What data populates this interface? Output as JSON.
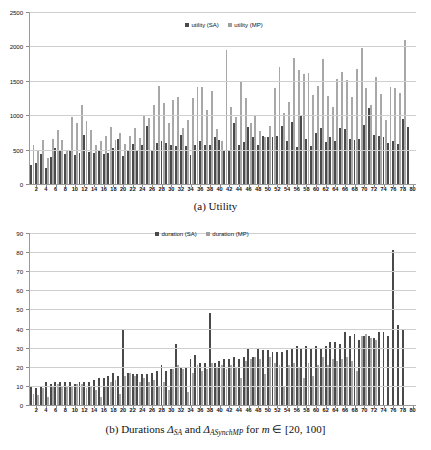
{
  "figure": {
    "panels": [
      {
        "id": "utility",
        "caption_prefix": "(a)",
        "caption_text": "Utility",
        "legend": [
          {
            "label": "utility (SA)",
            "color": "#4a4a4a",
            "key": "sa"
          },
          {
            "label": "utility (MP)",
            "color": "#9f9f9f",
            "key": "mp"
          }
        ]
      },
      {
        "id": "durations",
        "caption_prefix": "(b)",
        "caption_text": "Durations",
        "caption_sym1": "Δ",
        "caption_sub1": "SA",
        "caption_and": "and",
        "caption_sym2": "Δ",
        "caption_sub2": "ASynchMP",
        "caption_for": "for",
        "caption_var": "m",
        "caption_in": "∈",
        "caption_range": "[20, 100]",
        "legend": [
          {
            "label": "duration (SA)",
            "color": "#4a4a4a",
            "key": "sa"
          },
          {
            "label": "duration (MP)",
            "color": "#9f9f9f",
            "key": "mp"
          }
        ]
      }
    ]
  },
  "chart_data": [
    {
      "type": "bar",
      "id": "utility",
      "title": "(a) Utility",
      "xlabel": "",
      "ylabel": "",
      "ylim": [
        0,
        2500
      ],
      "yticks": [
        0,
        500,
        1000,
        1500,
        2000,
        2500
      ],
      "grid": true,
      "legend_position": "top-center",
      "x": [
        1,
        2,
        3,
        4,
        5,
        6,
        7,
        8,
        9,
        10,
        11,
        12,
        13,
        14,
        15,
        16,
        17,
        18,
        19,
        20,
        21,
        22,
        23,
        24,
        25,
        26,
        27,
        28,
        29,
        30,
        31,
        32,
        33,
        34,
        35,
        36,
        37,
        38,
        39,
        40,
        41,
        42,
        43,
        44,
        45,
        46,
        47,
        48,
        49,
        50,
        51,
        52,
        53,
        54,
        55,
        56,
        57,
        58,
        59,
        60,
        61,
        62,
        63,
        64,
        65,
        66,
        67,
        68,
        69,
        70,
        71,
        72,
        73,
        74,
        75,
        76,
        77,
        78,
        79,
        80
      ],
      "xtick_labels": [
        2,
        4,
        6,
        8,
        10,
        12,
        14,
        16,
        18,
        20,
        22,
        24,
        26,
        28,
        30,
        32,
        34,
        36,
        38,
        40,
        42,
        44,
        46,
        48,
        50,
        52,
        54,
        56,
        58,
        60,
        62,
        64,
        66,
        68,
        70,
        72,
        74,
        76,
        78,
        80
      ],
      "series": [
        {
          "name": "utility (SA)",
          "color": "#4a4a4a",
          "values": [
            280,
            300,
            440,
            230,
            390,
            530,
            500,
            430,
            480,
            420,
            450,
            710,
            460,
            450,
            480,
            440,
            450,
            530,
            650,
            400,
            480,
            580,
            500,
            560,
            840,
            490,
            600,
            620,
            600,
            560,
            550,
            710,
            555,
            425,
            565,
            620,
            570,
            560,
            690,
            640,
            490,
            500,
            890,
            560,
            605,
            825,
            680,
            560,
            700,
            680,
            690,
            700,
            840,
            630,
            905,
            545,
            1000,
            650,
            555,
            740,
            815,
            610,
            690,
            620,
            815,
            805,
            650,
            645,
            660,
            855,
            1105,
            710,
            700,
            680,
            600,
            620,
            585,
            940,
            830
          ]
        },
        {
          "name": "utility (MP)",
          "color": "#a8a8a8",
          "values": [
            570,
            495,
            645,
            375,
            655,
            780,
            640,
            500,
            975,
            880,
            1145,
            920,
            790,
            565,
            625,
            700,
            830,
            640,
            745,
            585,
            700,
            810,
            665,
            1000,
            960,
            1155,
            1420,
            1180,
            880,
            1225,
            1265,
            820,
            925,
            1250,
            1410,
            1415,
            1075,
            1345,
            800,
            620,
            1950,
            1115,
            970,
            1500,
            1250,
            885,
            1010,
            775,
            690,
            845,
            1400,
            1700,
            1030,
            1195,
            1835,
            1650,
            1600,
            1610,
            1290,
            1425,
            1815,
            1275,
            1125,
            1520,
            1630,
            1515,
            1270,
            1675,
            1975,
            1390,
            1155,
            1560,
            1305,
            925,
            1415,
            1395,
            1325,
            2090
          ]
        }
      ]
    },
    {
      "type": "bar",
      "id": "durations",
      "title": "(b) Durations Δ_SA and Δ_ASynchMP for m ∈ [20, 100]",
      "xlabel": "",
      "ylabel": "",
      "ylim": [
        0,
        90
      ],
      "yticks": [
        0,
        10,
        20,
        30,
        40,
        50,
        60,
        70,
        80,
        90
      ],
      "grid": true,
      "legend_position": "top-center",
      "x": [
        1,
        2,
        3,
        4,
        5,
        6,
        7,
        8,
        9,
        10,
        11,
        12,
        13,
        14,
        15,
        16,
        17,
        18,
        19,
        20,
        21,
        22,
        23,
        24,
        25,
        26,
        27,
        28,
        29,
        30,
        31,
        32,
        33,
        34,
        35,
        36,
        37,
        38,
        39,
        40,
        41,
        42,
        43,
        44,
        45,
        46,
        47,
        48,
        49,
        50,
        51,
        52,
        53,
        54,
        55,
        56,
        57,
        58,
        59,
        60,
        61,
        62,
        63,
        64,
        65,
        66,
        67,
        68,
        69,
        70,
        71,
        72,
        73,
        74,
        75,
        76,
        77,
        78,
        79,
        80
      ],
      "xtick_labels": [
        2,
        4,
        6,
        8,
        10,
        12,
        14,
        16,
        18,
        20,
        22,
        24,
        26,
        28,
        30,
        32,
        34,
        36,
        38,
        40,
        42,
        44,
        46,
        48,
        50,
        52,
        54,
        56,
        58,
        60,
        62,
        64,
        66,
        68,
        70,
        72,
        74,
        76,
        78,
        80
      ],
      "series": [
        {
          "name": "duration (SA)",
          "color": "#4a4a4a",
          "values": [
            10,
            9,
            10,
            12,
            11,
            12,
            12,
            12,
            12,
            11,
            12,
            12,
            12,
            13,
            14,
            14,
            15,
            17,
            15,
            39,
            17,
            16,
            16,
            16,
            16,
            17,
            18,
            21,
            18,
            19,
            32,
            20,
            20,
            24,
            26,
            22,
            22,
            48,
            22,
            23,
            24,
            24,
            25,
            24,
            25,
            30,
            25,
            30,
            29,
            29,
            28,
            28,
            28,
            29,
            30,
            31,
            30,
            31,
            30,
            31,
            30,
            31,
            33,
            33,
            32,
            38,
            36,
            37,
            34,
            36,
            36,
            35,
            38,
            38,
            36,
            81,
            42,
            39
          ]
        },
        {
          "name": "duration (MP)",
          "color": "#a8a8a8",
          "values": [
            6,
            5,
            9,
            4,
            10,
            11,
            10,
            10,
            10,
            11,
            11,
            9,
            10,
            8,
            4,
            10,
            12,
            13,
            6,
            15,
            17,
            15,
            12,
            14,
            12,
            13,
            10,
            12,
            8,
            19,
            21,
            19,
            7,
            17,
            21,
            18,
            19,
            22,
            20,
            21,
            19,
            21,
            20,
            14,
            23,
            24,
            25,
            24,
            16,
            25,
            22,
            21,
            10,
            21,
            22,
            20,
            14,
            22,
            15,
            21,
            25,
            21,
            24,
            23,
            24,
            25,
            23,
            18,
            36,
            37,
            35,
            34
          ]
        }
      ]
    }
  ]
}
